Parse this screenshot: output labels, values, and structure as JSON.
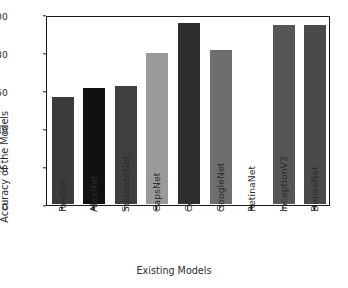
{
  "chart_data": {
    "type": "bar",
    "title": "",
    "xlabel": "Existing Models",
    "ylabel": "Accuracy of the Models",
    "categories": [
      "ResNet",
      "AlexNet",
      "SqueezeNet",
      "CapsNet",
      "CervixNet",
      "GoogleNet",
      "RetinaNet",
      "InceptionV3",
      "DenseNet"
    ],
    "values": [
      57.5,
      62.2,
      63.2,
      80.3,
      96.3,
      82.2,
      0,
      95.5,
      95.5
    ],
    "bar_colors": [
      "#3b3b3b",
      "#111111",
      "#3f3f3f",
      "#9a9a9a",
      "#2e2e2e",
      "#6e6e6e",
      "#ffffff",
      "#565656",
      "#4a4a4a"
    ],
    "ylim": [
      0,
      100
    ],
    "yticks": [
      0,
      20,
      40,
      60,
      80,
      100
    ],
    "ytick_labels": [
      "0",
      "20",
      "40",
      "60",
      "80",
      "100"
    ],
    "grid": false,
    "legend": null,
    "bar_edge_color": "#ffffff",
    "frame_color": "#1a1a1a",
    "background": "#ffffff"
  }
}
